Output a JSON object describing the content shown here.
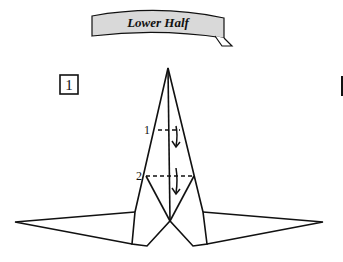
{
  "banner": {
    "title": "Lower Half"
  },
  "step": {
    "number": "1"
  },
  "folds": [
    {
      "label": "1",
      "type": "valley-fold-dashed"
    },
    {
      "label": "2",
      "type": "valley-fold-dashed"
    }
  ],
  "colors": {
    "line": "#111111",
    "banner_fill": "#d9d9d9",
    "background": "#ffffff"
  }
}
